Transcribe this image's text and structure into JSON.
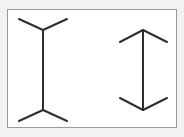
{
  "figure": {
    "canvas": {
      "width": 184,
      "height": 137
    },
    "colors": {
      "page_background": "#f2f2f0",
      "panel_background": "#ffffff",
      "frame_stroke": "#9a9a96",
      "line_stroke": "#2e2e2c"
    },
    "frame": {
      "x": 7,
      "y": 9,
      "width": 170,
      "height": 119,
      "stroke_width": 1
    },
    "stroke_width": 2,
    "figures": [
      {
        "name": "fins-out-figure",
        "label": "left",
        "fin_direction": "outward",
        "shaft": {
          "x": 43,
          "y_top": 30,
          "y_bottom": 110,
          "length": 80
        },
        "fins": [
          {
            "name": "top-left-fin",
            "x1": 43,
            "y1": 30,
            "x2": 19,
            "y2": 19
          },
          {
            "name": "top-right-fin",
            "x1": 43,
            "y1": 30,
            "x2": 67,
            "y2": 19
          },
          {
            "name": "bottom-left-fin",
            "x1": 43,
            "y1": 110,
            "x2": 19,
            "y2": 121
          },
          {
            "name": "bottom-right-fin",
            "x1": 43,
            "y1": 110,
            "x2": 67,
            "y2": 121
          }
        ]
      },
      {
        "name": "arrowheads-in-figure",
        "label": "right",
        "fin_direction": "inward",
        "shaft": {
          "x": 143,
          "y_top": 30,
          "y_bottom": 110,
          "length": 80
        },
        "fins": [
          {
            "name": "top-left-fin",
            "x1": 143,
            "y1": 30,
            "x2": 120,
            "y2": 42
          },
          {
            "name": "top-right-fin",
            "x1": 143,
            "y1": 30,
            "x2": 167,
            "y2": 42
          },
          {
            "name": "bottom-left-fin",
            "x1": 143,
            "y1": 110,
            "x2": 120,
            "y2": 98
          },
          {
            "name": "bottom-right-fin",
            "x1": 143,
            "y1": 110,
            "x2": 167,
            "y2": 98
          }
        ]
      }
    ]
  },
  "chart_data": {
    "type": "diagram",
    "xlabel": "",
    "ylabel": "",
    "categories": [
      "fins-out (left)",
      "arrowheads-in (right)"
    ],
    "values": [
      80,
      80
    ],
    "annotations": [
      "Both vertical shafts are 80 px long (physically equal).",
      "Left figure: wings splay outward at both ends (appears longer).",
      "Right figure: wings converge inward at both ends (appears shorter)."
    ],
    "legend": [],
    "grid": false
  }
}
